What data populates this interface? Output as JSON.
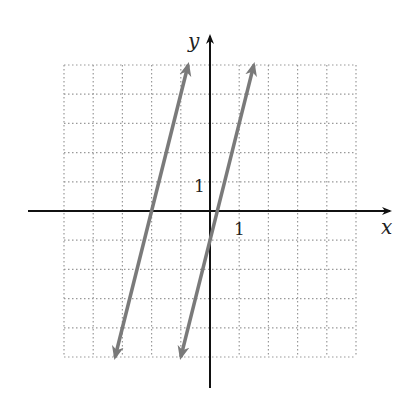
{
  "chart_data": {
    "type": "line",
    "title": "",
    "xlabel": "x",
    "ylabel": "y",
    "xlim": [
      -5,
      5
    ],
    "ylim": [
      -5,
      5
    ],
    "grid": true,
    "grid_style": "dotted",
    "tick_labels": {
      "x": "1",
      "y": "1"
    },
    "series": [
      {
        "name": "line-left",
        "equation": "y = 4x + 8",
        "slope": 4,
        "intercept": 8,
        "x_range": [
          -3.25,
          -0.75
        ]
      },
      {
        "name": "line-right",
        "equation": "y = 4x - 1",
        "slope": 4,
        "intercept": -1,
        "x_range": [
          -1,
          1.5
        ]
      }
    ],
    "line_color": "#7a7a7a",
    "axis_color": "#111111"
  },
  "labels": {
    "x_axis": "x",
    "y_axis": "y",
    "x_tick": "1",
    "y_tick": "1"
  }
}
